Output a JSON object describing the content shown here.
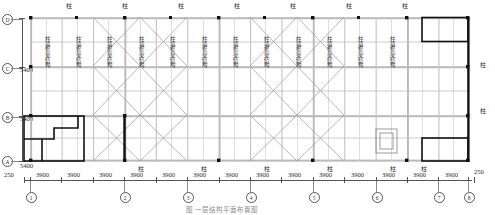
{
  "drawing": {
    "type": "structural-floor-plan",
    "caption": "图 一层结构平面布置图",
    "column_label": "柱",
    "bay_label": "柱墙框架结构"
  },
  "vertical_axis": {
    "labels": [
      "D",
      "C",
      "B",
      "A"
    ],
    "spacings": [
      "5400",
      "5400",
      "5400"
    ],
    "total": "16200"
  },
  "horizontal_axis": {
    "labels": [
      "1",
      "2",
      "3",
      "4",
      "5",
      "6",
      "7",
      "8"
    ],
    "edge_left": "250",
    "edge_right": "250",
    "bay_dimension": "3900",
    "bay_count": 14,
    "dimensions": [
      "250",
      "3900",
      "3900",
      "3900",
      "3900",
      "3900",
      "3900",
      "3900",
      "3900",
      "3900",
      "3900",
      "3900",
      "3900",
      "3900",
      "3900",
      "250"
    ]
  },
  "top_column_markers": {
    "label": "柱",
    "count": 7
  },
  "right_column_markers": {
    "label": "柱",
    "count": 2
  },
  "bottom_column_markers": {
    "label": "柱",
    "count": 6
  },
  "bay_text_labels": [
    "柱墙框架结构",
    "柱墙框架结构",
    "柱墙框架结构",
    "柱墙框架结构",
    "柱墙框架结构",
    "柱墙框架结构",
    "柱墙框架结构",
    "柱墙框架结构",
    "柱墙框架结构",
    "柱墙框架结构",
    "柱墙框架结构",
    "柱墙框架结构"
  ],
  "colors": {
    "wall": "#b9b9b9",
    "thin": "#9a9a9a",
    "bold": "#111111",
    "brace": "#8d8d8d",
    "dim": "#555555",
    "text": "#2b2b2b",
    "background": "#ffffff"
  }
}
